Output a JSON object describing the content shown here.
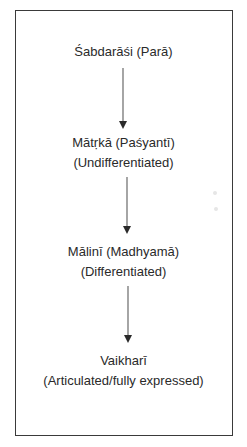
{
  "diagram": {
    "type": "vertical-flow",
    "border_color": "#3a3a3a",
    "arrow_color": "#444444",
    "nodes": [
      {
        "lines": [
          "Śabdarāśi (Parā)"
        ]
      },
      {
        "lines": [
          "Mātṛkā (Paśyantī)",
          "(Undifferentiated)"
        ]
      },
      {
        "lines": [
          "Mālinī (Madhyamā)",
          "(Differentiated)"
        ]
      },
      {
        "lines": [
          "Vaikharī",
          "(Articulated/fully expressed)"
        ]
      }
    ],
    "edges": [
      {
        "from": 0,
        "to": 1
      },
      {
        "from": 1,
        "to": 2
      },
      {
        "from": 2,
        "to": 3
      }
    ]
  }
}
